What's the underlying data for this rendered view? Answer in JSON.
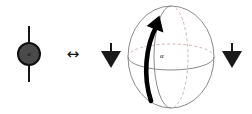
{
  "figure": {
    "background_color": "#ffffff",
    "width": 252,
    "height": 114
  },
  "left_token": {
    "name": "spin-token",
    "disc_label": "α",
    "disc_fill_color": "#4a4a4a",
    "disc_stroke_color": "#111111",
    "axis_color": "#151515"
  },
  "equivalence": {
    "symbol": "↔",
    "meaning": "equivalent-to",
    "color": "#111111"
  },
  "down_arrows": [
    {
      "name": "down-arrow-left",
      "glyph": "▼",
      "color": "#1a1a1a"
    },
    {
      "name": "down-arrow-right",
      "glyph": "▼",
      "color": "#1a1a1a"
    }
  ],
  "sphere": {
    "name": "bloch-sphere",
    "outline_color": "#8a8a8a",
    "equator_color": "#8a8a8a",
    "dashed_meridian_color": "#c9a9a9",
    "solid_meridian_color": "#8a8a8a",
    "rotation_arrow_color": "#000000",
    "angle_label": "α"
  }
}
